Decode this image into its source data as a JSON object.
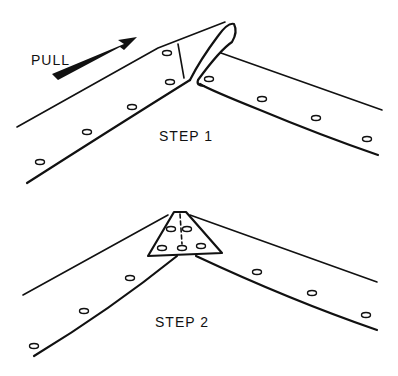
{
  "figure": {
    "steps": [
      {
        "id": "step1",
        "label": "STEP 1",
        "annotation": "PULL"
      },
      {
        "id": "step2",
        "label": "STEP 2"
      }
    ],
    "colors": {
      "ink": "#111111",
      "background": "#ffffff"
    }
  }
}
